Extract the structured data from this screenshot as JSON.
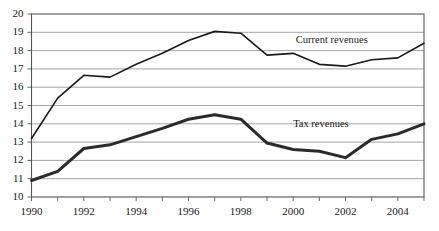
{
  "chart_data": {
    "type": "line",
    "title": "",
    "subtitle": "",
    "xlabel": "",
    "ylabel": "",
    "xlim": [
      1990,
      2005
    ],
    "ylim": [
      10,
      20
    ],
    "ytick_labels": [
      "20",
      "19",
      "18",
      "17",
      "16",
      "15",
      "14",
      "13",
      "12",
      "11",
      "10"
    ],
    "ytick_values": [
      20,
      19,
      18,
      17,
      16,
      15,
      14,
      13,
      12,
      11,
      10
    ],
    "xtick_labels": [
      "1990",
      "1992",
      "1994",
      "1996",
      "1998",
      "2000",
      "2002",
      "2004"
    ],
    "xtick_values": [
      1990,
      1992,
      1994,
      1996,
      1998,
      2000,
      2002,
      2004
    ],
    "xtick_minor_values": [
      1991,
      1993,
      1995,
      1997,
      1999,
      2001,
      2003,
      2005
    ],
    "grid": "horizontal",
    "legend_position": "inline-annotation",
    "x": [
      1990,
      1991,
      1992,
      1993,
      1994,
      1995,
      1996,
      1997,
      1998,
      1999,
      2000,
      2001,
      2002,
      2003,
      2004,
      2005
    ],
    "series": [
      {
        "name": "Current revenues",
        "color": "#1a1a1a",
        "line_width": 1.6,
        "values": [
          13.2,
          15.4,
          16.65,
          16.55,
          17.25,
          17.85,
          18.55,
          19.05,
          18.95,
          17.75,
          17.85,
          17.25,
          17.15,
          17.5,
          17.6,
          18.4
        ],
        "label_x": 2000.1,
        "label_y": 18.6
      },
      {
        "name": "Tax revenues",
        "color": "#2b2b2b",
        "line_width": 3.0,
        "values": [
          10.9,
          11.4,
          12.65,
          12.85,
          13.3,
          13.75,
          14.25,
          14.5,
          14.25,
          12.95,
          12.6,
          12.5,
          12.15,
          13.15,
          13.45,
          14.0
        ],
        "label_x": 2000.0,
        "label_y": 14.0
      }
    ]
  },
  "axes": {
    "frame_color": "#555555",
    "grid_color": "#9a9a9a",
    "tick_color": "#555555"
  }
}
